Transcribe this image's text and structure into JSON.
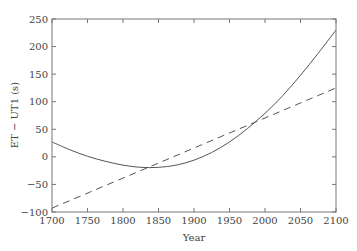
{
  "chart_data": {
    "type": "line",
    "title": "",
    "xlabel": "Year",
    "ylabel": "ET − UT1 (s)",
    "xlim": [
      1700,
      2100
    ],
    "ylim": [
      -100,
      250
    ],
    "xticks": [
      1700,
      1750,
      1800,
      1850,
      1900,
      1950,
      2000,
      2050,
      2100
    ],
    "yticks": [
      -100,
      -50,
      0,
      50,
      100,
      150,
      200,
      250
    ],
    "grid": false,
    "legend": null,
    "series": [
      {
        "name": "ET - UT1 (parabolic fit)",
        "style": "solid",
        "x": [
          1700,
          1725,
          1750,
          1775,
          1800,
          1825,
          1850,
          1875,
          1900,
          1925,
          1950,
          1975,
          2000,
          2025,
          2050,
          2075,
          2100
        ],
        "y": [
          27,
          13,
          1,
          -8,
          -15,
          -19,
          -19,
          -15,
          -6,
          8,
          27,
          51,
          79,
          111,
          148,
          188,
          230
        ]
      },
      {
        "name": "Linear trend",
        "style": "dashed",
        "x": [
          1700,
          2100
        ],
        "y": [
          -93,
          125
        ]
      }
    ]
  },
  "colors": {
    "line": "#555555",
    "axis": "#666666",
    "text": "#444444"
  }
}
